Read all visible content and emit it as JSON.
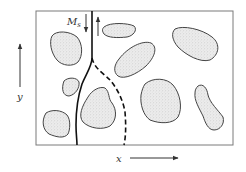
{
  "diagram": {
    "type": "schematic",
    "labels": {
      "magnetization": "M",
      "magnetization_subscript": "s",
      "y_axis": "y",
      "x_axis": "x"
    },
    "colors": {
      "frame": "#7a7a7a",
      "particle_outline": "#444444",
      "particle_fill": "#e6e6e6",
      "wall": "#111111",
      "arrow": "#333333"
    },
    "particle_count": 10,
    "elements": [
      "frame",
      "domain-wall-solid",
      "domain-wall-dashed",
      "magnetization-arrow-down",
      "magnetization-arrow-up",
      "y-axis-arrow",
      "x-axis-arrow"
    ]
  }
}
